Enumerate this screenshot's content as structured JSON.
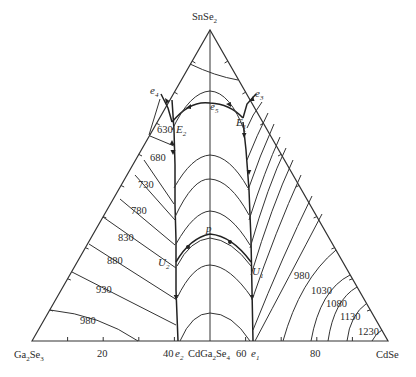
{
  "diagram": {
    "type": "ternary_phase_diagram",
    "corners": {
      "top": {
        "main": "SnSe",
        "sub": "2"
      },
      "left": {
        "main": "Ga",
        "sub1": "2",
        "mid": "Se",
        "sub2": "3"
      },
      "right": {
        "main": "CdSe"
      }
    },
    "base_axis": {
      "ticks": [
        "20",
        "40",
        "60",
        "80"
      ],
      "compound": {
        "a": "CdGa",
        "sub1": "2",
        "b": "Se",
        "sub2": "4"
      }
    },
    "points": {
      "e1": {
        "main": "e",
        "sub": "1"
      },
      "e2": {
        "main": "e",
        "sub": "2"
      },
      "e3": {
        "main": "e",
        "sub": "3"
      },
      "e4": {
        "main": "e",
        "sub": "4"
      },
      "e5": {
        "main": "e",
        "sub": "5"
      },
      "E1": {
        "main": "E",
        "sub": "1"
      },
      "E2": {
        "main": "E",
        "sub": "2"
      },
      "U1": {
        "main": "U",
        "sub": "1"
      },
      "U2": {
        "main": "U",
        "sub": "2"
      },
      "p": {
        "main": "p"
      }
    },
    "isotherms_left": [
      "630",
      "680",
      "730",
      "780",
      "830",
      "880",
      "930",
      "980"
    ],
    "isotherms_right": [
      "980",
      "1030",
      "1080",
      "1130",
      "1230"
    ]
  }
}
